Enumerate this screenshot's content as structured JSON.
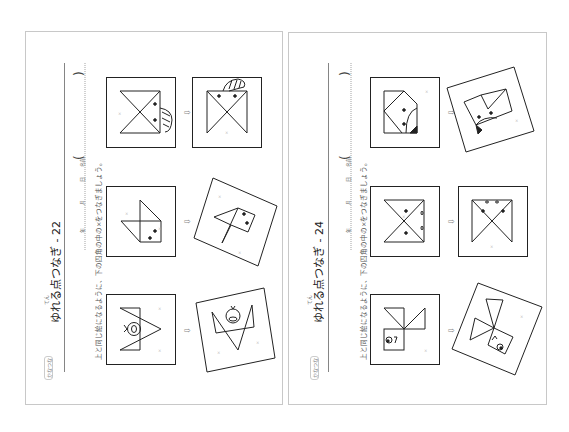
{
  "pages": [
    {
      "title": "ゆれる点つなぎ - 22",
      "title_ruby": "てん",
      "instruction": "上と同じ絵になるように、下の四角の中の×をつなぎましょう。",
      "date_fields": [
        "年",
        "月",
        "日",
        "名前"
      ],
      "paren_open": "(",
      "paren_close": ")",
      "arrow": "⇨",
      "figures": [
        "bird-in-square",
        "fish-kite",
        "bird-with-circle-face"
      ]
    },
    {
      "title": "ゆれる点つなぎ - 24",
      "title_ruby": "てん",
      "instruction": "上と同じ絵になるように、下の四角の中の×をつなぎましょう。",
      "date_fields": [
        "年",
        "月",
        "日",
        "名前"
      ],
      "paren_open": "(",
      "paren_close": ")",
      "arrow": "⇨",
      "figures": [
        "pentagon-face",
        "hourglass-face",
        "pinwheel-face"
      ]
    }
  ],
  "colors": {
    "line": "#222222",
    "border": "#c8c8c8",
    "dot": "#bbbbbb"
  }
}
